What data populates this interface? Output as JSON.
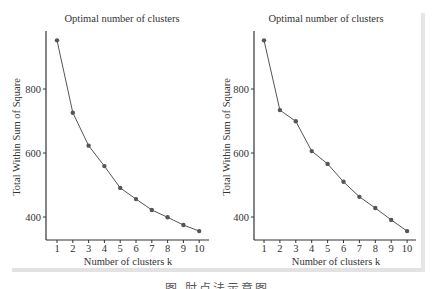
{
  "chart_data": [
    {
      "type": "line",
      "title": "Optimal number of clusters",
      "xlabel": "Number of clusters k",
      "ylabel": "Total Within Sum of Square",
      "x": [
        1,
        2,
        3,
        4,
        5,
        6,
        7,
        8,
        9,
        10
      ],
      "values": [
        952,
        726,
        623,
        559,
        491,
        456,
        422,
        399,
        375,
        356
      ],
      "yticks": [
        400,
        600,
        800
      ],
      "ylim": [
        330,
        980
      ],
      "xlim": [
        0.3,
        10.5
      ],
      "grid": false,
      "legend": null,
      "marker": "circle",
      "color": "#555555"
    },
    {
      "type": "line",
      "title": "Optimal number of clusters",
      "xlabel": "Number of clusters k",
      "ylabel": "Total Within Sum of Square",
      "x": [
        1,
        2,
        3,
        4,
        5,
        6,
        7,
        8,
        9,
        10
      ],
      "values": [
        952,
        734,
        699,
        606,
        566,
        510,
        463,
        428,
        391,
        356
      ],
      "yticks": [
        400,
        600,
        800
      ],
      "ylim": [
        330,
        980
      ],
      "xlim": [
        0.3,
        10.5
      ],
      "grid": false,
      "legend": null,
      "marker": "circle",
      "color": "#555555"
    }
  ],
  "charts": [
    {
      "title": "Optimal number of clusters",
      "xlabel": "Number of clusters k",
      "ylabel": "Total Within Sum of Square",
      "yticks": [
        "400",
        "600",
        "800"
      ],
      "xticks": [
        "1",
        "2",
        "3",
        "4",
        "5",
        "6",
        "7",
        "8",
        "9",
        "10"
      ]
    },
    {
      "title": "Optimal number of clusters",
      "xlabel": "Number of clusters k",
      "ylabel": "Total Within Sum of Square",
      "yticks": [
        "400",
        "600",
        "800"
      ],
      "xticks": [
        "1",
        "2",
        "3",
        "4",
        "5",
        "6",
        "7",
        "8",
        "9",
        "10"
      ]
    }
  ],
  "caption": "图 肘点法示意图"
}
